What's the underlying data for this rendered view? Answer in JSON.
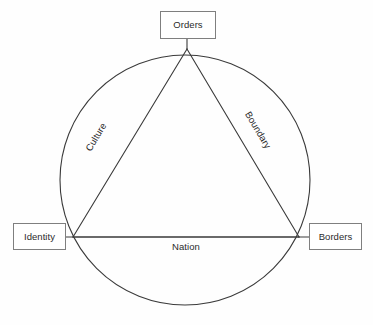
{
  "diagram": {
    "type": "triangle-in-circle",
    "background_color": "#ffffff",
    "stroke_color": "#3a3a3a",
    "box_border_color": "#7f7f7f",
    "text_color": "#2b2b2b",
    "nodes": [
      {
        "id": "orders",
        "label": "Orders",
        "position": "top"
      },
      {
        "id": "identity",
        "label": "Identity",
        "position": "left"
      },
      {
        "id": "borders",
        "label": "Borders",
        "position": "right"
      }
    ],
    "edges": [
      {
        "id": "culture",
        "label": "Culture",
        "from": "identity",
        "to": "orders",
        "rotation_deg": -59
      },
      {
        "id": "boundary",
        "label": "Boundary",
        "from": "orders",
        "to": "borders",
        "rotation_deg": 59
      },
      {
        "id": "nation",
        "label": "Nation",
        "from": "identity",
        "to": "borders",
        "rotation_deg": 0
      }
    ],
    "circle": {
      "cx": 185,
      "cy": 180,
      "r": 125
    },
    "triangle": {
      "apex": [
        187,
        49
      ],
      "left": [
        73,
        237
      ],
      "right": [
        299,
        237
      ]
    },
    "connectors": [
      {
        "from": "orders-box",
        "to": "triangle-apex"
      },
      {
        "from": "identity-box",
        "to": "triangle-left"
      },
      {
        "from": "borders-box",
        "to": "triangle-right"
      }
    ]
  }
}
